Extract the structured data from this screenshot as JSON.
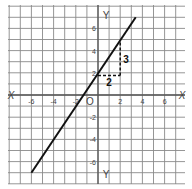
{
  "chart_data": {
    "type": "line",
    "title": "",
    "xlabel": "X",
    "ylabel": "Y",
    "xlim": [
      -8,
      8
    ],
    "ylim": [
      -8,
      8
    ],
    "grid": true,
    "x_ticks": [
      -6,
      -4,
      -2,
      2,
      4,
      6
    ],
    "y_ticks": [
      6,
      4,
      2,
      -2,
      -4,
      -6
    ],
    "x_tick_labels": [
      "-6",
      "-4",
      "-2",
      "2",
      "4",
      "6"
    ],
    "y_tick_labels": [
      "6",
      "4",
      "2",
      "-2",
      "-4",
      "-6"
    ],
    "origin_label": "O",
    "axis_labels": {
      "x_left": "X",
      "x_right": "X",
      "y_top": "Y",
      "y_bottom": "Y"
    },
    "series": [
      {
        "name": "line",
        "x": [
          -6,
          3.4
        ],
        "y": [
          -7,
          7
        ],
        "slope": 1.5,
        "y_intercept": 1.75
      }
    ],
    "annotations": [
      {
        "type": "slope-triangle",
        "run_label": "2",
        "rise_label": "3",
        "from": [
          0,
          1.75
        ],
        "corner": [
          2,
          1.75
        ],
        "to": [
          2,
          4.75
        ]
      }
    ]
  }
}
